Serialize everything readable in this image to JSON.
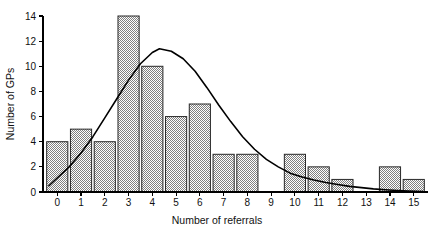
{
  "chart_data": {
    "type": "bar",
    "title": "",
    "xlabel": "Number of referrals",
    "ylabel": "Number of GPs",
    "categories": [
      "0",
      "1",
      "2",
      "3",
      "4",
      "5",
      "6",
      "7",
      "8",
      "9",
      "10",
      "11",
      "12",
      "13",
      "14",
      "15"
    ],
    "values": [
      4,
      5,
      4,
      14,
      10,
      6,
      7,
      3,
      3,
      0,
      3,
      2,
      1,
      0,
      2,
      1
    ],
    "xlim": [
      -0.6,
      15.6
    ],
    "ylim": [
      0,
      14
    ],
    "xticks": [
      "0",
      "1",
      "2",
      "3",
      "4",
      "5",
      "6",
      "7",
      "8",
      "9",
      "10",
      "11",
      "12",
      "13",
      "14",
      "15"
    ],
    "yticks": [
      "0",
      "2",
      "4",
      "6",
      "8",
      "10",
      "12",
      "14"
    ],
    "grid": false,
    "legend": null,
    "series": [
      {
        "name": "Number of GPs",
        "values": [
          4,
          5,
          4,
          14,
          10,
          6,
          7,
          3,
          3,
          0,
          3,
          2,
          1,
          0,
          2,
          1
        ]
      },
      {
        "name": "fitted normal curve",
        "type": "line",
        "peak_x": 4.3,
        "peak_y": 11.4,
        "points": [
          [
            -0.35,
            0.5
          ],
          [
            0.5,
            2.0
          ],
          [
            1.0,
            3.1
          ],
          [
            1.5,
            4.4
          ],
          [
            2.0,
            5.9
          ],
          [
            2.5,
            7.4
          ],
          [
            3.0,
            8.9
          ],
          [
            3.5,
            10.2
          ],
          [
            4.0,
            11.1
          ],
          [
            4.3,
            11.4
          ],
          [
            4.8,
            11.2
          ],
          [
            5.3,
            10.6
          ],
          [
            5.8,
            9.6
          ],
          [
            6.3,
            8.3
          ],
          [
            6.8,
            6.9
          ],
          [
            7.3,
            5.6
          ],
          [
            7.8,
            4.4
          ],
          [
            8.3,
            3.4
          ],
          [
            8.8,
            2.6
          ],
          [
            9.3,
            2.0
          ],
          [
            9.8,
            1.5
          ],
          [
            10.3,
            1.2
          ],
          [
            10.8,
            0.95
          ],
          [
            11.3,
            0.75
          ],
          [
            11.8,
            0.6
          ],
          [
            12.3,
            0.45
          ],
          [
            12.8,
            0.35
          ],
          [
            13.3,
            0.25
          ],
          [
            13.8,
            0.18
          ],
          [
            14.3,
            0.12
          ],
          [
            14.8,
            0.08
          ],
          [
            15.4,
            0.04
          ]
        ]
      }
    ],
    "colors": {
      "bar_fill": "#b0b0b0",
      "bar_edge": "#2a2a2a",
      "curve": "#000000",
      "axis": "#000000",
      "text": "#111111",
      "background": "#ffffff"
    }
  }
}
